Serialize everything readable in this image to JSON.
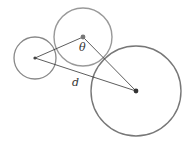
{
  "diagram": {
    "type": "geometry",
    "colors": {
      "background": "#ffffff",
      "circle_stroke": "#888888",
      "line": "#333333",
      "dot": "#444444",
      "label": "#333333"
    },
    "circles": [
      {
        "id": "small",
        "cx": 35,
        "cy": 58,
        "r": 21
      },
      {
        "id": "middle",
        "cx": 83,
        "cy": 37,
        "r": 29
      },
      {
        "id": "large",
        "cx": 136,
        "cy": 91,
        "r": 45
      }
    ],
    "segments": [
      {
        "from": "small",
        "to": "middle"
      },
      {
        "from": "middle",
        "to": "large"
      },
      {
        "from": "small",
        "to": "large"
      }
    ],
    "labels": {
      "theta": "θ",
      "d": "d"
    }
  }
}
